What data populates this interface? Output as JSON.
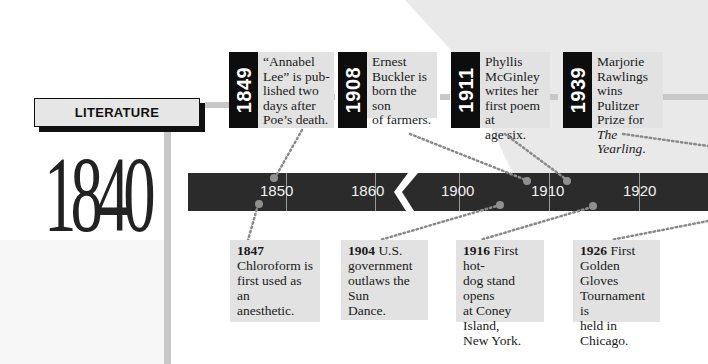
{
  "section": {
    "label": "LITERATURE",
    "decade": "1840"
  },
  "literature_events": [
    {
      "year": "1849",
      "lines": [
        "“Annabel",
        "Lee” is pub-",
        "lished two",
        "days after",
        "Poe’s death."
      ]
    },
    {
      "year": "1908",
      "lines": [
        "Ernest",
        "Buckler is",
        "born the son",
        "of farmers."
      ]
    },
    {
      "year": "1911",
      "lines": [
        "Phyllis",
        "McGinley",
        "writes her",
        "first poem at",
        "age six."
      ]
    },
    {
      "year": "1939",
      "lines": [
        "Marjorie",
        "Rawlings",
        "wins Pulitzer",
        "Prize for ",
        "Yearling."
      ],
      "italic_title": "The Yearling"
    }
  ],
  "timeline": {
    "ticks": [
      "1850",
      "1860",
      "1900",
      "1910",
      "1920"
    ],
    "break_between": [
      "1860",
      "1900"
    ],
    "bar_color": "#2b2b2b"
  },
  "world_events": [
    {
      "year": "1847",
      "text": "Chloroform is first used as an anesthetic."
    },
    {
      "year": "1904",
      "text": "U.S. government outlaws the Sun Dance."
    },
    {
      "year": "1916",
      "text": "First hot-dog stand opens at Coney Island, New York."
    },
    {
      "year": "1926",
      "text": "First Golden Gloves Tournament is held in Chicago."
    }
  ],
  "card_lines": {
    "c1": [
      "“Annabel",
      "Lee” is pub-",
      "lished two",
      "days after",
      "Poe’s death."
    ],
    "c2": [
      "Ernest",
      "Buckler is",
      "born the son",
      "of farmers."
    ],
    "c3": [
      "Phyllis",
      "McGinley",
      "writes her",
      "first poem at",
      "age six."
    ],
    "c4a": [
      "Marjorie",
      "Rawlings",
      "wins Pulitzer",
      "Prize for "
    ],
    "c4_title_part1": "The",
    "c4_title_part2": "Yearling",
    "b1": [
      "Chloroform is",
      "first used as an",
      "anesthetic."
    ],
    "b2_first": "U.S.",
    "b2": [
      "government",
      "outlaws the Sun",
      "Dance."
    ],
    "b3_first": "First hot-",
    "b3": [
      "dog stand opens",
      "at Coney Island,",
      "New York."
    ],
    "b4_first": "First",
    "b4": [
      "Golden Gloves",
      "Tournament is",
      "held in",
      "Chicago."
    ]
  }
}
